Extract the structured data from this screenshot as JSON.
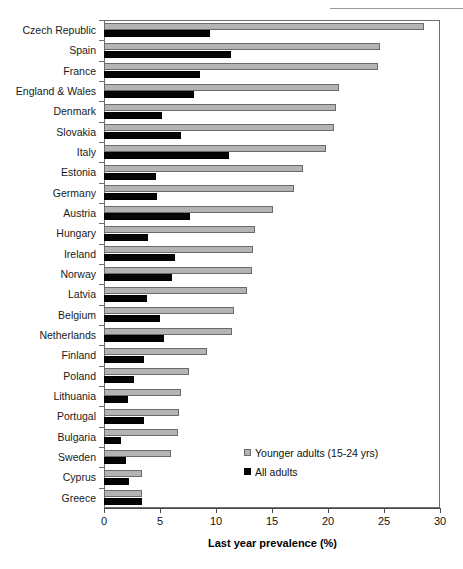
{
  "header": {
    "note": ""
  },
  "chart_data": {
    "type": "bar",
    "orientation": "horizontal",
    "title": "",
    "xlabel": "Last year prevalence (%)",
    "ylabel": "",
    "xlim": [
      0,
      30
    ],
    "xticks": [
      0,
      5,
      10,
      15,
      20,
      25,
      30
    ],
    "grid": false,
    "legend_position": "inside-bottom-right",
    "categories": [
      "Czech Republic",
      "Spain",
      "France",
      "England & Wales",
      "Denmark",
      "Slovakia",
      "Italy",
      "Estonia",
      "Germany",
      "Austria",
      "Hungary",
      "Ireland",
      "Norway",
      "Latvia",
      "Belgium",
      "Netherlands",
      "Finland",
      "Poland",
      "Lithuania",
      "Portugal",
      "Bulgaria",
      "Sweden",
      "Cyprus",
      "Greece"
    ],
    "series": [
      {
        "name": "Younger adults  (15-24 yrs)",
        "color": "#b4b4b4",
        "values": [
          28.6,
          24.6,
          24.5,
          21.0,
          20.7,
          20.5,
          19.8,
          17.8,
          17.0,
          15.1,
          13.5,
          13.3,
          13.2,
          12.8,
          11.6,
          11.4,
          9.2,
          7.6,
          6.9,
          6.7,
          6.6,
          6.0,
          3.4,
          3.4
        ],
        "legend_swatch": "gray-square"
      },
      {
        "name": "All adults",
        "color": "#050505",
        "values": [
          9.5,
          11.3,
          8.6,
          8.0,
          5.2,
          6.9,
          11.2,
          4.6,
          4.7,
          7.7,
          3.9,
          6.3,
          6.1,
          3.8,
          5.0,
          5.4,
          3.6,
          2.7,
          2.1,
          3.6,
          1.5,
          2.0,
          2.2,
          3.4
        ],
        "legend_swatch": "black-square"
      }
    ]
  }
}
